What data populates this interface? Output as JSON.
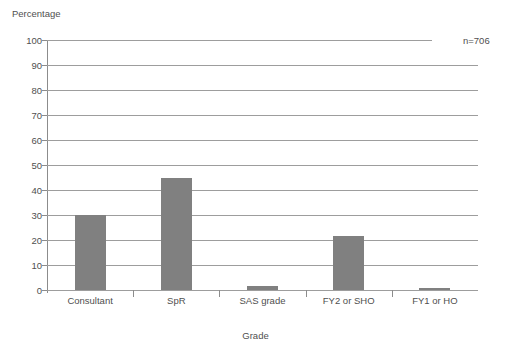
{
  "chart_data": {
    "type": "bar",
    "title": "",
    "categories": [
      "Consultant",
      "SpR",
      "SAS grade",
      "FY2 or SHO",
      "FY1 or HO"
    ],
    "values": [
      30,
      45,
      1.5,
      21.5,
      1
    ],
    "xlabel": "Grade",
    "ylabel": "Percentage",
    "ylim": [
      0,
      100
    ],
    "yticks": [
      0,
      10,
      20,
      30,
      40,
      50,
      60,
      70,
      80,
      90,
      100
    ],
    "ytick_labels": [
      "0",
      "10",
      "20",
      "30",
      "40",
      "50",
      "60",
      "70",
      "80",
      "90",
      "100"
    ],
    "grid": true,
    "legend": "none",
    "annotations": [
      {
        "text": "n=706",
        "position": "top-right"
      }
    ],
    "bar_color": "#808080",
    "grid_color": "#9d9d9d",
    "axis_color": "#8c8c8c",
    "text_color": "#4f4f4f"
  }
}
